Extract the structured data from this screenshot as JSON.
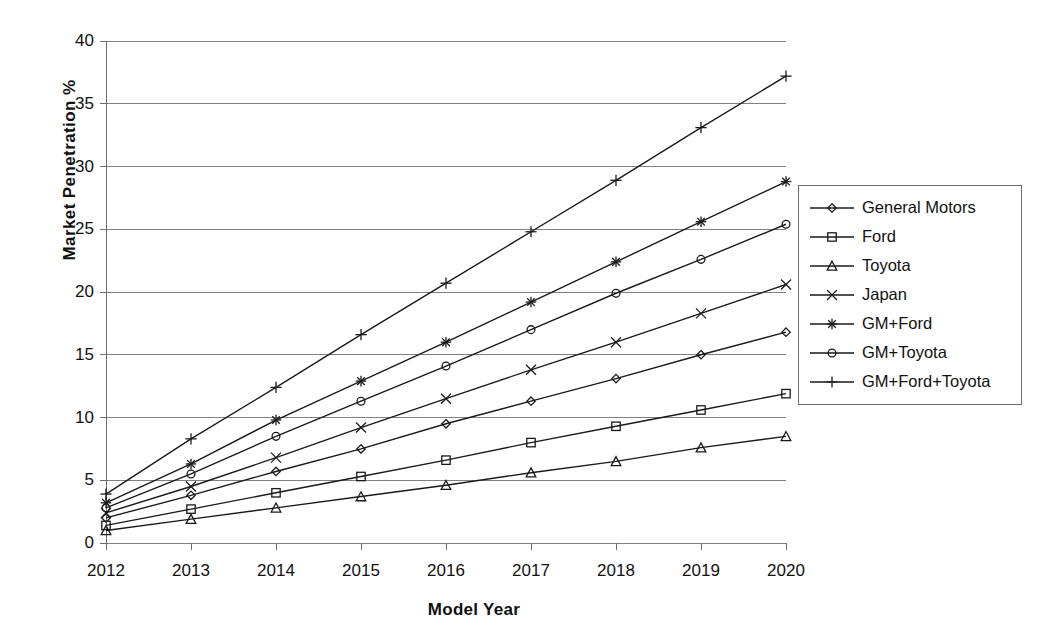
{
  "chart_data": {
    "type": "line",
    "title": "",
    "xlabel": "Model Year",
    "ylabel": "Market Penetration %",
    "categories": [
      "2012",
      "2013",
      "2014",
      "2015",
      "2016",
      "2017",
      "2018",
      "2019",
      "2020"
    ],
    "x": [
      2012,
      2013,
      2014,
      2015,
      2016,
      2017,
      2018,
      2019,
      2020
    ],
    "xlim": [
      2012,
      2020
    ],
    "ylim": [
      0,
      40
    ],
    "y_ticks": [
      0,
      5,
      10,
      15,
      20,
      25,
      30,
      35,
      40
    ],
    "x_ticks": [
      "2012",
      "2013",
      "2014",
      "2015",
      "2016",
      "2017",
      "2018",
      "2019",
      "2020"
    ],
    "grid": "horizontal",
    "legend_position": "right",
    "series": [
      {
        "name": "General Motors",
        "marker": "diamond",
        "values": [
          2.0,
          3.8,
          5.7,
          7.5,
          9.5,
          11.3,
          13.1,
          15.0,
          16.8
        ]
      },
      {
        "name": "Ford",
        "marker": "square",
        "values": [
          1.4,
          2.7,
          4.0,
          5.3,
          6.6,
          8.0,
          9.3,
          10.6,
          11.9
        ]
      },
      {
        "name": "Toyota",
        "marker": "triangle",
        "values": [
          1.0,
          1.9,
          2.8,
          3.7,
          4.6,
          5.6,
          6.5,
          7.6,
          8.5
        ]
      },
      {
        "name": "Japan",
        "marker": "x",
        "values": [
          2.4,
          4.5,
          6.8,
          9.2,
          11.5,
          13.8,
          16.0,
          18.3,
          20.6
        ]
      },
      {
        "name": "GM+Ford",
        "marker": "asterisk",
        "values": [
          3.2,
          6.3,
          9.8,
          12.9,
          16.0,
          19.2,
          22.4,
          25.6,
          28.8
        ]
      },
      {
        "name": "GM+Toyota",
        "marker": "circle",
        "values": [
          2.8,
          5.5,
          8.5,
          11.3,
          14.1,
          17.0,
          19.9,
          22.6,
          25.4
        ]
      },
      {
        "name": "GM+Ford+Toyota",
        "marker": "plus",
        "values": [
          3.9,
          8.3,
          12.4,
          16.6,
          20.7,
          24.8,
          28.9,
          33.1,
          37.2
        ]
      }
    ]
  },
  "colors": {
    "line": "#1a1a1a",
    "grid": "#808080",
    "axis": "#6d6d6d",
    "background": "#ffffff",
    "text": "#111111"
  },
  "legend": {
    "items": [
      {
        "label": "General Motors",
        "marker": "diamond"
      },
      {
        "label": "Ford",
        "marker": "square"
      },
      {
        "label": "Toyota",
        "marker": "triangle"
      },
      {
        "label": "Japan",
        "marker": "x"
      },
      {
        "label": "GM+Ford",
        "marker": "asterisk"
      },
      {
        "label": "GM+Toyota",
        "marker": "circle"
      },
      {
        "label": "GM+Ford+Toyota",
        "marker": "plus"
      }
    ]
  }
}
